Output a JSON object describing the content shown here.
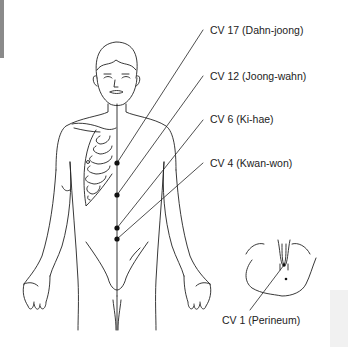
{
  "diagram": {
    "line_color": "#222222",
    "point_color": "#111111",
    "points": [
      {
        "id": "cv17",
        "label": "CV 17 (Dahn-joong)",
        "x": 117,
        "y": 163,
        "label_x": 210,
        "label_y": 24,
        "line_end_x": 203,
        "line_end_y": 30
      },
      {
        "id": "cv12",
        "label": "CV 12 (Joong-wahn)",
        "x": 117,
        "y": 195,
        "label_x": 210,
        "label_y": 70,
        "line_end_x": 203,
        "line_end_y": 76
      },
      {
        "id": "cv6",
        "label": "CV 6 (Ki-hae)",
        "x": 117,
        "y": 228,
        "label_x": 210,
        "label_y": 113,
        "line_end_x": 203,
        "line_end_y": 120
      },
      {
        "id": "cv4",
        "label": "CV 4 (Kwan-won)",
        "x": 117,
        "y": 239,
        "label_x": 210,
        "label_y": 157,
        "line_end_x": 203,
        "line_end_y": 163
      }
    ],
    "inset": {
      "label": "CV 1 (Perineum)",
      "point_x": 284,
      "point_y": 265,
      "label_x": 222,
      "label_y": 314
    }
  }
}
